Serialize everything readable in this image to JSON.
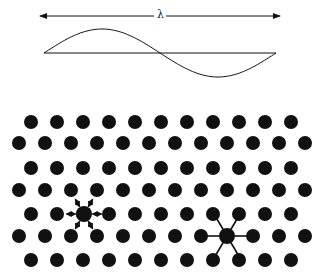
{
  "diagram": {
    "wavelength_label": "λ",
    "colors": {
      "ink": "#111111",
      "background": "#ffffff"
    },
    "wave": {
      "x_start": 44,
      "x_end": 276,
      "midline_y": 53,
      "amplitude": 24,
      "arrow_y": 16,
      "arrow_x_start": 40,
      "arrow_x_end": 280
    },
    "lattice": {
      "row_ys": [
        122,
        143,
        168,
        190,
        214,
        236,
        260
      ],
      "odd_row": {
        "x_start": 31,
        "count": 11
      },
      "even_row": {
        "x_start": 19,
        "count": 12
      },
      "spacing": 26,
      "dot_radius": 7
    },
    "vibrating_atom": {
      "label": "atom with vibration arrows",
      "x": 84,
      "y": 214
    },
    "bonded_atom": {
      "label": "atom with bonds to nearest neighbours",
      "x": 227,
      "y": 236
    }
  }
}
